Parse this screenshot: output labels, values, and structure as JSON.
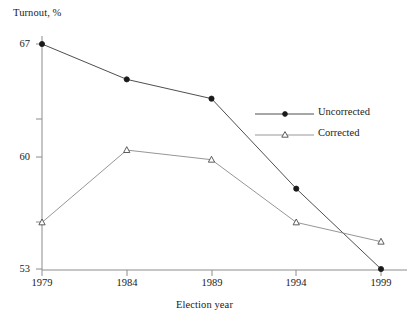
{
  "chart_data": {
    "type": "line",
    "title": "",
    "xlabel": "Election year",
    "ylabel": "Turnout, %",
    "categories": [
      "1979",
      "1984",
      "1989",
      "1994",
      "1999"
    ],
    "x": [
      1979,
      1984,
      1989,
      1994,
      1999
    ],
    "xlim": [
      1979,
      1999
    ],
    "ylim": [
      53,
      67
    ],
    "yticks": [
      53,
      60,
      67
    ],
    "ytick_labels": [
      "53",
      "60",
      "67"
    ],
    "y_minor_ticks": [
      55.9,
      63.7
    ],
    "grid": false,
    "legend_position": "center-right",
    "series": [
      {
        "name": "Uncorrected",
        "marker": "filled-circle",
        "values": [
          67.0,
          64.8,
          63.6,
          58.0,
          53.0
        ]
      },
      {
        "name": "Corrected",
        "marker": "open-triangle",
        "values": [
          55.9,
          60.4,
          59.8,
          55.9,
          54.7
        ]
      }
    ],
    "colors": {
      "line": "#333333",
      "axis": "#888888",
      "text": "#1a1a1a",
      "background": "#ffffff"
    }
  },
  "legend": {
    "items": [
      {
        "label": "Uncorrected"
      },
      {
        "label": "Corrected"
      }
    ]
  },
  "axes": {
    "y_title": "Turnout, %",
    "x_title": "Election year"
  }
}
